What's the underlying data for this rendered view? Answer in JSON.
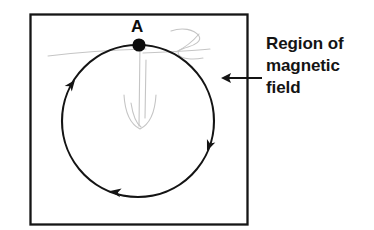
{
  "figure": {
    "background_color": "#ffffff",
    "ink_color": "#111111",
    "pencil_color": "#b9b9b9"
  },
  "region": {
    "name": "magnetic-field-region",
    "shape": "square",
    "border_color": "#151515",
    "fill_color": "#ffffff",
    "x": 30,
    "y": 14,
    "width": 218,
    "height": 211
  },
  "path": {
    "name": "circular-trajectory",
    "shape": "circle",
    "center_x": 138,
    "center_y": 121,
    "radius": 76,
    "direction": "clockwise",
    "stroke_color": "#141414"
  },
  "point": {
    "label": "A",
    "marker": "filled-dot",
    "x": 139,
    "y": 45,
    "radius": 6.5,
    "color": "#0d0d0d"
  },
  "direction_arrows": [
    {
      "name": "arrowhead-upper-left",
      "x": 74,
      "y": 80,
      "angle_deg": -48
    },
    {
      "name": "arrowhead-right",
      "x": 207,
      "y": 150,
      "angle_deg": 227
    },
    {
      "name": "arrowhead-bottom",
      "x": 111,
      "y": 190,
      "angle_deg": 152
    }
  ],
  "callout": {
    "name": "region-callout",
    "lines": [
      "Region of",
      "magnetic",
      "field"
    ],
    "line1": "Region of",
    "line2": "magnetic",
    "line3": "field",
    "arrow": {
      "name": "callout-arrow",
      "tail_x": 262,
      "tail_y": 78,
      "tip_x": 222,
      "tip_y": 78,
      "points": "left"
    }
  },
  "pencil_marks": {
    "name": "faint-pencil-annotations",
    "description": "Faint gray hand-drawn velocity vector and scribbles",
    "color": "#c2c2c2",
    "items": [
      "vertical-line-from-A",
      "v-shape-arrowhead",
      "horizontal-stroke-left",
      "zigzag-scribble-upper-right"
    ]
  }
}
